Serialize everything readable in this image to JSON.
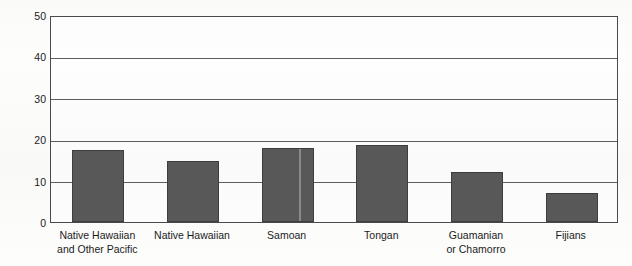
{
  "chart_data": {
    "type": "bar",
    "title": "",
    "subtitle": "",
    "xlabel": "",
    "ylabel": "Percent below poverty",
    "ylim": [
      0,
      50
    ],
    "yticks": [
      "0",
      "10",
      "20",
      "30",
      "40",
      "50"
    ],
    "grid": true,
    "legend": false,
    "categories": [
      "Native Hawaiian\nand Other Pacific",
      "Native Hawaiian",
      "Samoan",
      "Tongan",
      "Guamanian\nor Chamorro",
      "Fijians"
    ],
    "values": [
      17.5,
      14.8,
      17.8,
      18.5,
      12.2,
      7.0
    ],
    "bar_color": "#59595a",
    "bar_border_color": "#3e3e3f",
    "frame_color": "#4a4a4a",
    "gridline_color": "#5e5e5e",
    "background_color": "#fdfdfc",
    "text_color": "#1b1b1b"
  }
}
